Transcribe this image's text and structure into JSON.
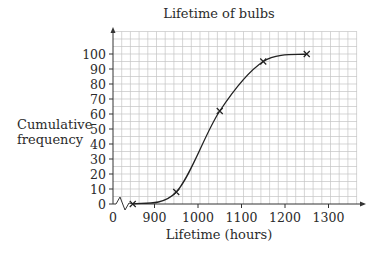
{
  "chart_data": {
    "type": "line",
    "title": "Lifetime of bulbs",
    "xlabel": "Lifetime (hours)",
    "ylabel": "Cumulative frequency",
    "x_tick_labels": [
      "0",
      "900",
      "1000",
      "1100",
      "1200",
      "1300"
    ],
    "y_tick_labels": [
      "0",
      "10",
      "20",
      "30",
      "40",
      "50",
      "60",
      "70",
      "80",
      "90",
      "100"
    ],
    "xlim": [
      0,
      1360
    ],
    "ylim": [
      0,
      115
    ],
    "axis_break": "x-axis between 0 and 900",
    "grid": true,
    "grid_minor_x": 20,
    "grid_minor_y": 5,
    "marker": "cross",
    "smooth_curve": true,
    "points": {
      "x": [
        850,
        950,
        1050,
        1150,
        1250
      ],
      "y": [
        0,
        8,
        62,
        95,
        100
      ]
    }
  }
}
